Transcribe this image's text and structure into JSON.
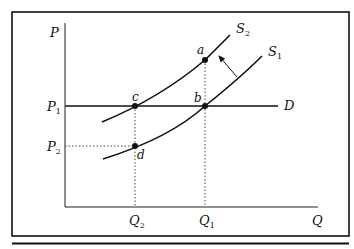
{
  "diagram": {
    "type": "supply-demand",
    "axes": {
      "y_label": "P",
      "x_label": "Q"
    },
    "price_levels": [
      {
        "id": "P1",
        "label": "P",
        "sub": "1"
      },
      {
        "id": "P2",
        "label": "P",
        "sub": "2"
      }
    ],
    "quantity_levels": [
      {
        "id": "Q2",
        "label": "Q",
        "sub": "2"
      },
      {
        "id": "Q1",
        "label": "Q",
        "sub": "1"
      }
    ],
    "curves": [
      {
        "id": "S2",
        "label": "S",
        "sub": "2"
      },
      {
        "id": "S1",
        "label": "S",
        "sub": "1"
      },
      {
        "id": "D",
        "label": "D",
        "sub": ""
      }
    ],
    "points": [
      {
        "id": "a",
        "label": "a"
      },
      {
        "id": "b",
        "label": "b"
      },
      {
        "id": "c",
        "label": "c"
      },
      {
        "id": "d",
        "label": "d"
      }
    ],
    "shift_arrow": "S1 to S2 (upward/leftward shift)",
    "colors": {
      "ink": "#111111",
      "background": "#ffffff"
    }
  }
}
